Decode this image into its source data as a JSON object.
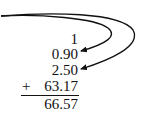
{
  "addition": {
    "addends": [
      "1",
      "0.90",
      "2.50",
      "63.17"
    ],
    "operator": "+",
    "sum": "66.57"
  },
  "arrows": [
    {
      "name": "arrow-to-0.90",
      "target": "0.90"
    },
    {
      "name": "arrow-to-2.50",
      "target": "2.50"
    }
  ],
  "colors": {
    "ink": "#111111",
    "background": "#ffffff"
  }
}
